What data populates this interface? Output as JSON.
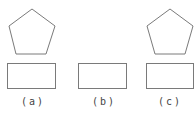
{
  "figure": {
    "stroke_color": "#7a7a7a",
    "panels": [
      {
        "id": "a",
        "label": "(a)",
        "has_pentagon": true,
        "has_rectangle": true
      },
      {
        "id": "b",
        "label": "(b)",
        "has_pentagon": false,
        "has_rectangle": true
      },
      {
        "id": "c",
        "label": "(c)",
        "has_pentagon": true,
        "has_rectangle": true
      }
    ]
  }
}
